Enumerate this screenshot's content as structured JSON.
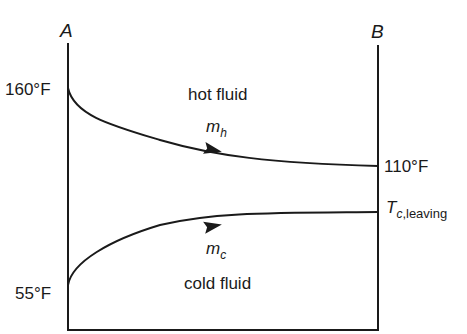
{
  "diagram": {
    "type": "heat-exchanger-temperature-profile",
    "ends": {
      "left": {
        "label": "A"
      },
      "right": {
        "label": "B"
      }
    },
    "hot_stream": {
      "region_label": "hot fluid",
      "flow_symbol": "m",
      "flow_subscript": "h",
      "inlet_temperature": "160°F",
      "outlet_temperature": "110°F"
    },
    "cold_stream": {
      "region_label": "cold fluid",
      "flow_symbol": "m",
      "flow_subscript": "c",
      "inlet_temperature": "55°F",
      "outlet_symbol": "T",
      "outlet_subscript_italic": "c",
      "outlet_subscript_text": ",leaving"
    },
    "colors": {
      "line": "#1a1a1a",
      "background": "#ffffff"
    }
  }
}
